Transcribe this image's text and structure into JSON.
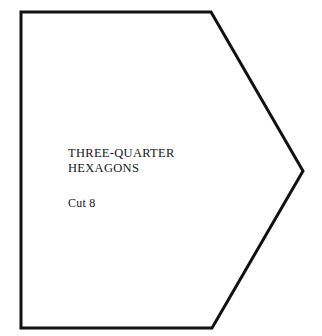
{
  "sheet": {
    "background_color": "#ffffff"
  },
  "shape": {
    "name": "three-quarter-hexagon",
    "stroke_color": "#111111",
    "fill_color": "#ffffff",
    "stroke_width": 3,
    "points": "21,12 211,12 303,171 212,328 21,328",
    "vertices": [
      {
        "label": "top-left",
        "x": 21,
        "y": 12
      },
      {
        "label": "top-right",
        "x": 211,
        "y": 12
      },
      {
        "label": "right-apex",
        "x": 303,
        "y": 171
      },
      {
        "label": "bottom-right",
        "x": 212,
        "y": 328
      },
      {
        "label": "bottom-left",
        "x": 21,
        "y": 328
      }
    ]
  },
  "labels": {
    "title": "THREE-QUARTER\nHEXAGONS",
    "title_line_1": "THREE-QUARTER",
    "title_line_2": "HEXAGONS",
    "cut_instruction": "Cut 8"
  }
}
